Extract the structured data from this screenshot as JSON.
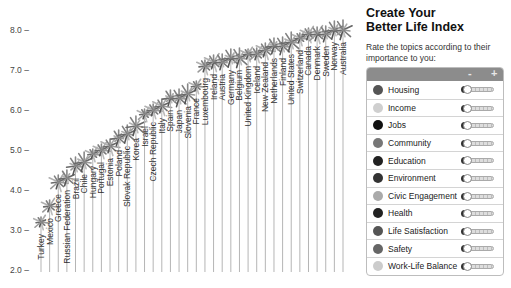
{
  "chart_data": {
    "type": "scatter",
    "xlabel": "",
    "ylabel": "",
    "ylim": [
      2.0,
      8.0
    ],
    "yticks": [
      "2.0",
      "3.0",
      "4.0",
      "5.0",
      "6.0",
      "7.0",
      "8.0"
    ],
    "categories": [
      "Turkey",
      "Mexico",
      "Greece",
      "Russian Federation",
      "Brazil",
      "Chile",
      "Hungary",
      "Portugal",
      "Estonia",
      "Poland",
      "Slovak Republic",
      "Korea",
      "Israel",
      "Czech Republic",
      "Italy",
      "Spain",
      "Japan",
      "Slovenia",
      "France",
      "Luxembourg",
      "Ireland",
      "Austria",
      "Germany",
      "Belgium",
      "United Kingdom",
      "Iceland",
      "New Zealand",
      "Netherlands",
      "Finland",
      "United States",
      "Switzerland",
      "Canada",
      "Denmark",
      "Sweden",
      "Norway",
      "Australia"
    ],
    "values": [
      3.2,
      3.6,
      4.2,
      4.3,
      4.6,
      4.7,
      4.9,
      5.0,
      5.1,
      5.3,
      5.4,
      5.6,
      5.9,
      6.0,
      6.1,
      6.3,
      6.3,
      6.4,
      6.6,
      7.1,
      7.2,
      7.2,
      7.3,
      7.3,
      7.4,
      7.4,
      7.5,
      7.6,
      7.6,
      7.7,
      7.8,
      7.9,
      7.9,
      7.9,
      8.0,
      8.0
    ],
    "grid": false,
    "legend": "none"
  },
  "panel": {
    "title_line1": "Create Your",
    "title_line2": "Better Life Index",
    "subtitle": "Rate the topics according to their importance to you:",
    "minus_label": "-",
    "plus_label": "+",
    "topics": [
      {
        "label": "Housing",
        "icon": "house-icon",
        "color": "#555555"
      },
      {
        "label": "Income",
        "icon": "money-icon",
        "color": "#cfcfcf"
      },
      {
        "label": "Jobs",
        "icon": "briefcase-icon",
        "color": "#111111"
      },
      {
        "label": "Community",
        "icon": "people-icon",
        "color": "#777777"
      },
      {
        "label": "Education",
        "icon": "book-icon",
        "color": "#222222"
      },
      {
        "label": "Environment",
        "icon": "leaf-icon",
        "color": "#333333"
      },
      {
        "label": "Civic Engagement",
        "icon": "ballot-icon",
        "color": "#aaaaaa"
      },
      {
        "label": "Health",
        "icon": "cross-icon",
        "color": "#222222"
      },
      {
        "label": "Life Satisfaction",
        "icon": "heart-icon",
        "color": "#555555"
      },
      {
        "label": "Safety",
        "icon": "shield-icon",
        "color": "#666666"
      },
      {
        "label": "Work-Life Balance",
        "icon": "clock-icon",
        "color": "#cccccc"
      }
    ]
  }
}
